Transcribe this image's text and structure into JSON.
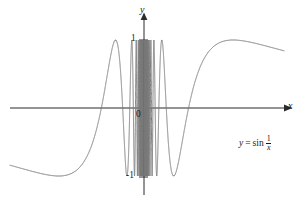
{
  "figure": {
    "title": "",
    "background_color": "#ffffff",
    "curve_color": "#7a7a7a",
    "axis_color": "#2b2b2b",
    "text_color": "#1a1a1a"
  },
  "labels": {
    "y_axis": "y",
    "x_axis": "x",
    "origin": "0",
    "tick_one": "1",
    "tick_neg_one": "-1",
    "curve_equation_lhs": "y",
    "curve_equation_eq": "=",
    "curve_equation_fn": "sin",
    "curve_equation_num": "1",
    "curve_equation_den": "x"
  },
  "chart_data": {
    "type": "line",
    "title": "",
    "xlabel": "x",
    "ylabel": "y",
    "equation": "y = sin(1/x)",
    "xlim": [
      -1.05,
      1.05
    ],
    "ylim": [
      -1.35,
      1.35
    ],
    "grid": false,
    "legend": "none",
    "annotations": [
      {
        "text": "y = sin 1/x",
        "x": 0.72,
        "y": -0.55
      },
      {
        "text": "1",
        "x": -0.06,
        "y": 1.0
      },
      {
        "text": "-1",
        "x": -0.09,
        "y": -1.0
      },
      {
        "text": "0",
        "x": -0.04,
        "y": -0.08
      }
    ],
    "yticks": [
      -1,
      1
    ],
    "ytick_labels": [
      "-1",
      "1"
    ],
    "xticks": [],
    "xtick_labels": [],
    "series": [
      {
        "name": "y = sin(1/x)",
        "color": "#7a7a7a",
        "x_domain": [
          -1.0,
          1.0
        ],
        "excluded_x": 0,
        "description": "sine of reciprocal of x; oscillation frequency increases without bound as x approaches 0 from either side; amplitude constant at 1",
        "amplitude": 1,
        "sample_note": "curve evaluated on a dense sample of x in [-1, 0) and (0, 1]"
      }
    ]
  }
}
